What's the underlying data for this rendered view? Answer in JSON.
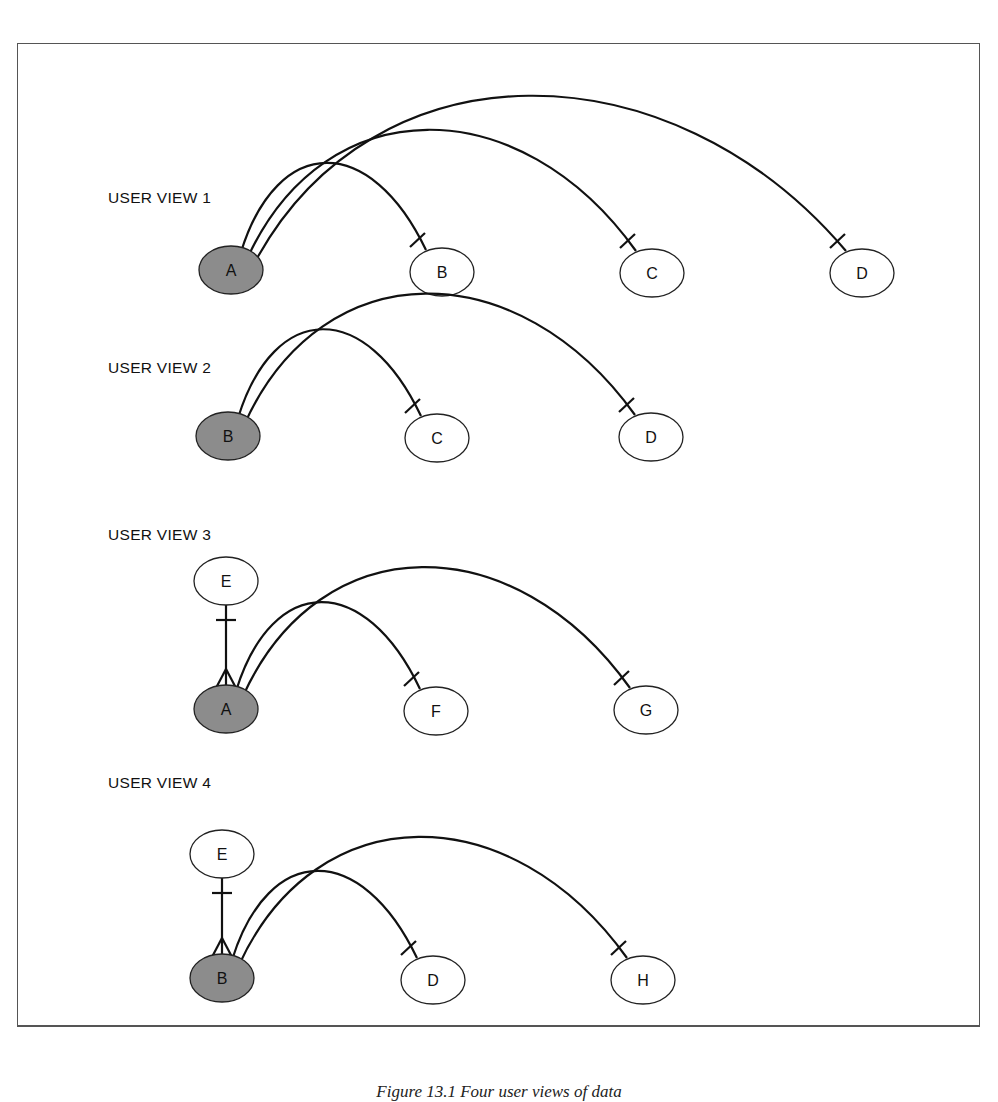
{
  "figure": {
    "caption": "Figure 13.1   Four user views of data",
    "colors": {
      "shaded_entity": "#8c8c8c",
      "line": "#111111",
      "background": "#ffffff"
    }
  },
  "views": [
    {
      "title": "USER VIEW 1",
      "title_pos": [
        108,
        203
      ],
      "root": {
        "label": "A",
        "cx": 231,
        "cy": 270
      },
      "children": [
        {
          "label": "B",
          "cx": 442,
          "cy": 272
        },
        {
          "label": "C",
          "cx": 652,
          "cy": 273
        },
        {
          "label": "D",
          "cx": 862,
          "cy": 273
        }
      ],
      "owner": null
    },
    {
      "title": "USER VIEW 2",
      "title_pos": [
        108,
        373
      ],
      "root": {
        "label": "B",
        "cx": 228,
        "cy": 436
      },
      "children": [
        {
          "label": "C",
          "cx": 437,
          "cy": 438
        },
        {
          "label": "D",
          "cx": 651,
          "cy": 437
        }
      ],
      "owner": null
    },
    {
      "title": "USER VIEW 3",
      "title_pos": [
        108,
        540
      ],
      "root": {
        "label": "A",
        "cx": 226,
        "cy": 709
      },
      "children": [
        {
          "label": "F",
          "cx": 436,
          "cy": 711
        },
        {
          "label": "G",
          "cx": 646,
          "cy": 710
        }
      ],
      "owner": {
        "label": "E",
        "cx": 226,
        "cy": 581
      }
    },
    {
      "title": "USER VIEW 4",
      "title_pos": [
        108,
        788
      ],
      "root": {
        "label": "B",
        "cx": 222,
        "cy": 978
      },
      "children": [
        {
          "label": "D",
          "cx": 433,
          "cy": 980
        },
        {
          "label": "H",
          "cx": 643,
          "cy": 980
        }
      ],
      "owner": {
        "label": "E",
        "cx": 222,
        "cy": 854
      }
    }
  ]
}
